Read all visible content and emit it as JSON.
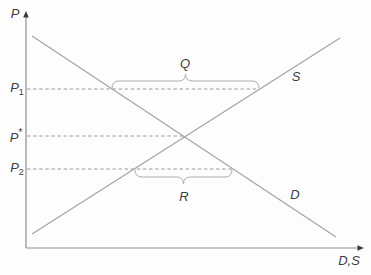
{
  "diagram": {
    "background": "#fdfdfd",
    "colors": {
      "axis": "#8f8f8f",
      "curve": "#a4a4a4",
      "dashed_line": "#9c9c9c",
      "brace": "#aeaeae",
      "text": "#3e3e3e",
      "arrowhead": "#3a3a3a"
    },
    "axes": {
      "origin_x": 26,
      "origin_y": 248,
      "y_arrow_tip": 11,
      "x_arrow_tip": 364
    },
    "labels": {
      "y_axis": {
        "text": "P",
        "x": 15,
        "y": 13
      },
      "x_axis": {
        "text": "D,S",
        "x": 349,
        "y": 260
      },
      "supply": {
        "text": "S",
        "x": 296,
        "y": 76
      },
      "demand": {
        "text": "D",
        "x": 295,
        "y": 194
      },
      "brace_q": {
        "text": "Q",
        "x": 185,
        "y": 63
      },
      "brace_r": {
        "text": "R",
        "x": 184,
        "y": 196
      }
    },
    "curves": [
      {
        "id": "demand",
        "label": "D",
        "x1": 32,
        "y1": 36,
        "x2": 336,
        "y2": 237
      },
      {
        "id": "supply",
        "label": "S",
        "x1": 32,
        "y1": 234,
        "x2": 340,
        "y2": 38
      }
    ],
    "price_lines": [
      {
        "id": "p1",
        "y": 89,
        "x_start": 27,
        "x_end": 259,
        "main": "P",
        "sub": "1"
      },
      {
        "id": "p-star",
        "y": 136,
        "x_start": 27,
        "x_end": 185,
        "main": "P",
        "sup": "*"
      },
      {
        "id": "p2",
        "y": 169,
        "x_start": 27,
        "x_end": 232,
        "main": "P",
        "sub": "2"
      }
    ],
    "price_labels": [
      {
        "main": "P",
        "sub": "1",
        "x": 17,
        "y": 89
      },
      {
        "main": "P",
        "sup": "*",
        "x": 16,
        "y": 136
      },
      {
        "main": "P",
        "sub": "2",
        "x": 17,
        "y": 169
      }
    ],
    "braces": [
      {
        "id": "q",
        "label": "Q",
        "x1": 112,
        "x2": 259,
        "y_base": 88,
        "direction": "up",
        "curl": 7
      },
      {
        "id": "r",
        "label": "R",
        "x1": 135,
        "x2": 232,
        "y_base": 170,
        "direction": "down",
        "curl": 7
      }
    ]
  }
}
